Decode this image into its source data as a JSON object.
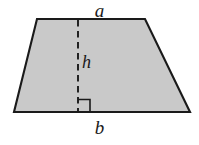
{
  "figure": {
    "kind": "trapezoid-area-diagram",
    "background_color": "#ffffff",
    "fill_color": "#c9c9c9",
    "stroke_color": "#1a1a1a",
    "labels": {
      "top_base": "a",
      "bottom_base": "b",
      "height": "h"
    },
    "geometry": {
      "top_left": [
        37,
        19
      ],
      "top_right": [
        145,
        19
      ],
      "bottom_right": [
        190,
        112
      ],
      "bottom_left": [
        14,
        112
      ],
      "height_line_x": 78,
      "height_line_from_y": 19,
      "height_line_to_y": 112,
      "right_angle_size": 12
    }
  }
}
